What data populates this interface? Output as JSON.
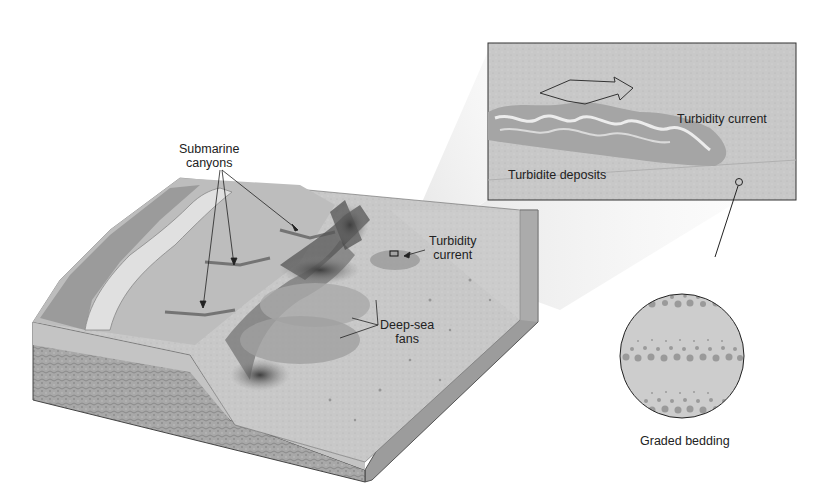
{
  "figure": {
    "type": "block diagram of continental margin",
    "colors": {
      "background": "#ffffff",
      "shelf": "#b9b9b9",
      "shelf_light": "#d8d8d8",
      "slope_dark": "#6e6e6e",
      "floor": "#cfcfcf",
      "rock_face": "#a3a3a3",
      "inset_bg": "#c9c9c9",
      "outline": "#333333",
      "label_text": "#222222"
    }
  },
  "labels": {
    "submarine_canyons": [
      "Submarine",
      "canyons"
    ],
    "turbidity_current_main": [
      "Turbidity",
      "current"
    ],
    "deep_sea_fans": [
      "Deep-sea",
      "fans"
    ]
  },
  "inset": {
    "turbidity_current": "Turbidity current",
    "turbidite_deposits": "Turbidite deposits",
    "arrow": "flow-direction-arrow"
  },
  "circle_inset": {
    "caption": "Graded bedding",
    "layers": 3
  }
}
